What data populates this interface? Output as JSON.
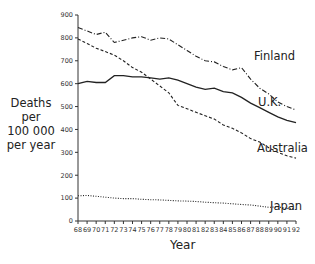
{
  "chart_data": {
    "type": "line",
    "title": "",
    "xlabel": "Year",
    "ylabel": "Deaths per 100 000 per year",
    "ylabel_lines": [
      "Deaths",
      "per",
      "100 000",
      "per year"
    ],
    "x": [
      68,
      69,
      70,
      71,
      72,
      73,
      74,
      75,
      76,
      77,
      78,
      79,
      80,
      81,
      82,
      83,
      84,
      85,
      86,
      87,
      88,
      89,
      90,
      91,
      92
    ],
    "xlim": [
      68,
      92
    ],
    "ylim": [
      0,
      900
    ],
    "yticks": [
      0,
      100,
      200,
      300,
      400,
      500,
      600,
      700,
      800,
      900
    ],
    "grid": false,
    "legend": "inline labels at right",
    "series": [
      {
        "name": "Finland",
        "style": "dash-dot",
        "values": [
          845,
          830,
          815,
          825,
          780,
          790,
          800,
          805,
          790,
          800,
          795,
          770,
          745,
          720,
          700,
          695,
          675,
          660,
          670,
          620,
          580,
          555,
          520,
          500,
          485
        ]
      },
      {
        "name": "U.K.",
        "style": "solid",
        "values": [
          600,
          610,
          605,
          605,
          635,
          635,
          630,
          630,
          625,
          620,
          625,
          615,
          600,
          585,
          575,
          580,
          565,
          560,
          540,
          515,
          495,
          475,
          455,
          440,
          430
        ]
      },
      {
        "name": "Australia",
        "style": "dashed",
        "values": [
          795,
          775,
          755,
          740,
          725,
          700,
          670,
          650,
          620,
          590,
          560,
          505,
          490,
          475,
          460,
          445,
          420,
          405,
          385,
          360,
          345,
          320,
          300,
          285,
          275
        ]
      },
      {
        "name": "Japan",
        "style": "dotted",
        "values": [
          110,
          112,
          108,
          104,
          100,
          98,
          98,
          95,
          93,
          92,
          90,
          88,
          87,
          85,
          82,
          80,
          78,
          75,
          72,
          70,
          65,
          60,
          62,
          55,
          50
        ]
      }
    ]
  },
  "labels": {
    "ylabel": "Deaths per 100 000 per year",
    "xlabel": "Year",
    "finland": "Finland",
    "uk": "U.K.",
    "australia": "Australia",
    "japan": "Japan"
  }
}
